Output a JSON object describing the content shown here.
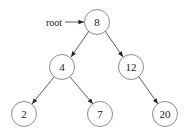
{
  "diagram": {
    "type": "binary-search-tree",
    "pointer_label": "root",
    "nodes": [
      {
        "id": "n8",
        "label": "8",
        "cx": 97,
        "cy": 22
      },
      {
        "id": "n4",
        "label": "4",
        "cx": 62,
        "cy": 67
      },
      {
        "id": "n12",
        "label": "12",
        "cx": 131,
        "cy": 67
      },
      {
        "id": "n2",
        "label": "2",
        "cx": 24,
        "cy": 114
      },
      {
        "id": "n7",
        "label": "7",
        "cx": 100,
        "cy": 114
      },
      {
        "id": "n20",
        "label": "20",
        "cx": 165,
        "cy": 114
      }
    ],
    "edges": [
      {
        "from": "n8",
        "to": "n4"
      },
      {
        "from": "n8",
        "to": "n12"
      },
      {
        "from": "n4",
        "to": "n2"
      },
      {
        "from": "n4",
        "to": "n7"
      },
      {
        "from": "n12",
        "to": "n20"
      }
    ],
    "node_radius": 12.5,
    "colors": {
      "node_stroke": "#6e6e6e",
      "edge": "#333333",
      "text": "#222222",
      "background": "#ffffff"
    }
  }
}
